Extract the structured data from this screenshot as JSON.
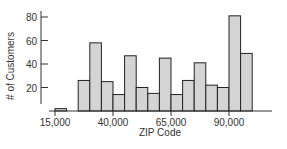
{
  "chart_data": {
    "type": "bar",
    "subtype": "histogram",
    "title": "",
    "xlabel": "ZIP Code",
    "ylabel": "# of Customers",
    "bin_width": 5000,
    "bin_starts": [
      15000,
      20000,
      25000,
      30000,
      35000,
      40000,
      45000,
      50000,
      55000,
      60000,
      65000,
      70000,
      75000,
      80000,
      85000,
      90000,
      95000
    ],
    "categories": [
      "15000-20000",
      "20000-25000",
      "25000-30000",
      "30000-35000",
      "35000-40000",
      "40000-45000",
      "45000-50000",
      "50000-55000",
      "55000-60000",
      "60000-65000",
      "65000-70000",
      "70000-75000",
      "75000-80000",
      "80000-85000",
      "85000-90000",
      "90000-95000",
      "95000-100000"
    ],
    "values": [
      2,
      0,
      26,
      58,
      25,
      14,
      47,
      20,
      15,
      45,
      14,
      26,
      41,
      22,
      20,
      81,
      49
    ],
    "x_ticks": [
      15000,
      40000,
      65000,
      90000
    ],
    "x_tick_labels": [
      "15,000",
      "40,000",
      "65,000",
      "90,000"
    ],
    "y_ticks": [
      20,
      40,
      60,
      80
    ],
    "y_tick_labels": [
      "20",
      "40",
      "60",
      "80"
    ],
    "xlim": [
      13000,
      105000
    ],
    "ylim": [
      0,
      85
    ],
    "grid": false,
    "legend": null,
    "colors": {
      "bar_fill": "#d4d4d4",
      "bar_stroke": "#222222",
      "axis": "#333333"
    }
  }
}
